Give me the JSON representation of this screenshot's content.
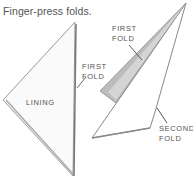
{
  "caption": "Finger-press folds.",
  "labels": {
    "first_fold_left_1": "FIRST",
    "first_fold_left_2": "FOLD",
    "lining": "LINING",
    "first_fold_right_1": "FIRST",
    "first_fold_right_2": "FOLD",
    "second_fold_1": "SECOND",
    "second_fold_2": "FOLD"
  },
  "colors": {
    "paper": "#ffffff",
    "outline": "#888888",
    "fold_strip": "#b8b8b8",
    "text": "#555555"
  }
}
